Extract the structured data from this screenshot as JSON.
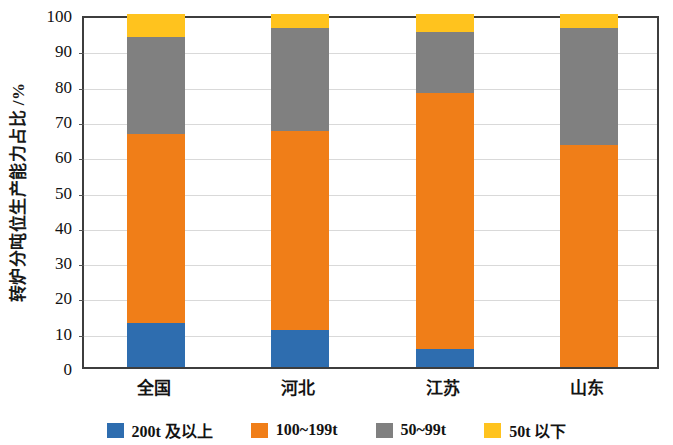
{
  "chart_data": {
    "type": "bar",
    "stacked": true,
    "title": "",
    "xlabel": "",
    "ylabel": "转炉分吨位生产能力占比 /%",
    "ylim": [
      0,
      100
    ],
    "yticks": [
      0,
      10,
      20,
      30,
      40,
      50,
      60,
      70,
      80,
      90,
      100
    ],
    "ytick_labels": [
      "0",
      "10",
      "20",
      "30",
      "40",
      "50",
      "60",
      "70",
      "80",
      "90",
      "100"
    ],
    "grid": true,
    "grid_axis": "y",
    "legend_position": "bottom",
    "categories": [
      "全国",
      "河北",
      "江苏",
      "山东"
    ],
    "series": [
      {
        "name": "200t 及以上",
        "color": "#2E6DAF",
        "values": [
          12.5,
          10.5,
          5.0,
          0.0
        ]
      },
      {
        "name": "100~199t",
        "color": "#F07E18",
        "values": [
          53.5,
          56.5,
          72.5,
          63.0
        ]
      },
      {
        "name": "50~99t",
        "color": "#808080",
        "values": [
          27.5,
          29.0,
          17.5,
          33.0
        ]
      },
      {
        "name": "50t 以下",
        "color": "#FFC31E",
        "values": [
          6.5,
          4.0,
          5.0,
          4.0
        ]
      }
    ],
    "cumulative_tops": {
      "全国": [
        12.5,
        66.0,
        93.5,
        100.0
      ],
      "河北": [
        10.5,
        67.0,
        96.0,
        100.0
      ],
      "江苏": [
        5.0,
        77.5,
        95.0,
        100.0
      ],
      "山东": [
        0.0,
        63.0,
        96.0,
        100.0
      ]
    }
  },
  "legend": {
    "items": [
      {
        "label": "200t 及以上",
        "color": "#2E6DAF"
      },
      {
        "label": "100~199t",
        "color": "#F07E18"
      },
      {
        "label": "50~99t",
        "color": "#808080"
      },
      {
        "label": "50t 以下",
        "color": "#FFC31E"
      }
    ]
  },
  "axes": {
    "y_title": "转炉分吨位生产能力占比 /%"
  }
}
